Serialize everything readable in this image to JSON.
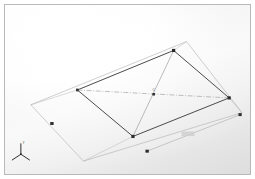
{
  "app": {
    "title": "3D Model Viewport",
    "background_top_color": "#fdfdfd",
    "background_edge_color": "#d8d8d8",
    "frame_border_color": "#b9b9b9"
  },
  "viewport": {
    "name": "graphics-area",
    "width": 247,
    "height": 171
  },
  "model": {
    "name": "planar-quadrilateral-sketch",
    "solid_edge_color": "#4a4a4a",
    "construction_edge_color": "#a8a8a8",
    "centerline_color": "#8c8c8c",
    "vertex_color": "#2b2b2b",
    "solid_face": {
      "label": "Main planar face",
      "vertices": [
        {
          "name": "vertex-left",
          "x": 77,
          "y": 90
        },
        {
          "name": "vertex-top",
          "x": 174,
          "y": 50
        },
        {
          "name": "vertex-right",
          "x": 230,
          "y": 98
        },
        {
          "name": "vertex-bottom",
          "x": 133,
          "y": 137
        }
      ]
    },
    "construction_face": {
      "label": "Offset reference plane",
      "vertices": [
        {
          "name": "ref-vertex-top-left",
          "x": 30,
          "y": 105
        },
        {
          "name": "ref-vertex-top-right",
          "x": 187,
          "y": 41
        },
        {
          "name": "ref-vertex-bottom-right",
          "x": 243,
          "y": 113
        },
        {
          "name": "ref-vertex-bottom-left",
          "x": 83,
          "y": 162
        }
      ]
    },
    "diagonals": [
      {
        "name": "diagonal-a",
        "from": {
          "x": 77,
          "y": 90
        },
        "to": {
          "x": 230,
          "y": 98
        }
      },
      {
        "name": "diagonal-b",
        "from": {
          "x": 174,
          "y": 50
        },
        "to": {
          "x": 133,
          "y": 137
        }
      }
    ],
    "center_point": {
      "name": "diagonal-intersection",
      "x": 154,
      "y": 94,
      "label": "C"
    },
    "vertex_markers": [
      {
        "name": "marker-left-edge",
        "x": 51,
        "y": 124
      },
      {
        "name": "marker-bottom-edge",
        "x": 147,
        "y": 152
      },
      {
        "name": "marker-right-edge",
        "x": 241,
        "y": 115
      }
    ]
  },
  "dimension": {
    "name": "linear-dimension",
    "value": "",
    "line": {
      "from": {
        "x": 147,
        "y": 152
      },
      "to": {
        "x": 241,
        "y": 115
      }
    },
    "text_position": {
      "x": 186,
      "y": 135
    }
  },
  "axis_triad": {
    "name": "coordinate-triad",
    "origin": {
      "x": 20,
      "y": 155
    },
    "labels": {
      "y": "Y",
      "x": "X",
      "z": "Z"
    },
    "color": "#2e2e2e"
  }
}
